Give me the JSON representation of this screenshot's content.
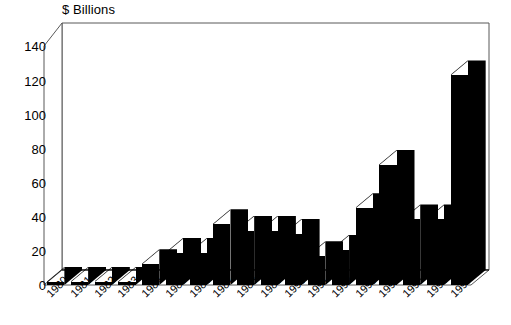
{
  "chart_data": {
    "type": "bar",
    "title": "$ Billions",
    "subtitle": "",
    "xlabel": "",
    "ylabel": "$ Billions",
    "ylim": [
      0,
      140
    ],
    "ytick_step": 20,
    "yticks": [
      140,
      120,
      100,
      80,
      60,
      40,
      20,
      0
    ],
    "ytick_labels": [
      "140",
      "120",
      "100",
      "80",
      "60",
      "40",
      "20",
      "0"
    ],
    "grid": false,
    "legend": "none",
    "style": "3d-column",
    "bar_color": "#000000",
    "background_color": "#FFFFFF",
    "axis_color": "#000000",
    "categories": [
      "1980",
      "1981",
      "1982",
      "1983",
      "1984",
      "1985",
      "1986",
      "1987",
      "1988",
      "1989",
      "1990",
      "1991",
      "1992",
      "1993",
      "1994",
      "1995",
      "1996",
      "1997"
    ],
    "values": [
      1,
      1,
      1,
      1,
      13,
      20,
      20,
      38,
      34,
      34,
      32,
      18,
      22,
      48,
      75,
      41,
      41,
      75
    ],
    "series": [
      {
        "name": "Value",
        "values": [
          1,
          1,
          1,
          1,
          13,
          20,
          20,
          38,
          34,
          34,
          32,
          18,
          22,
          48,
          75,
          41,
          41,
          75
        ]
      }
    ],
    "last_value_override": {
      "category": "1997",
      "value": 131
    },
    "annotations": []
  },
  "axes": {
    "y_title": "$ Billions",
    "y_tick_labels": [
      "140",
      "120",
      "100",
      "80",
      "60",
      "40",
      "20",
      "0"
    ],
    "x_tick_labels": [
      "1980",
      "1981",
      "1982",
      "1983",
      "1984",
      "1985",
      "1986",
      "1987",
      "1988",
      "1989",
      "1990",
      "1991",
      "1992",
      "1993",
      "1994",
      "1995",
      "1996",
      "1997"
    ]
  }
}
